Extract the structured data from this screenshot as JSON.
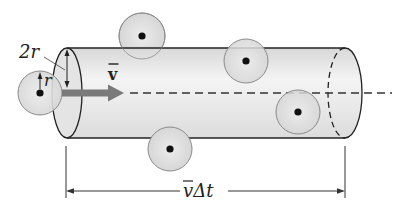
{
  "labels": {
    "diameter": "2r",
    "radius": "r",
    "velocity": "v",
    "distance": "v̄Δt",
    "distance_v": "v",
    "distance_rest": "Δt"
  },
  "colors": {
    "cylinder_fill": "#e9e9e9",
    "sphere_fill": "#dcdcdc",
    "sphere_stroke": "#8a8a8a",
    "outline": "#222222",
    "arrow": "#7a7a7a"
  },
  "molecules": [
    {
      "cx": 40,
      "cy": 93,
      "r": 22
    },
    {
      "cx": 142,
      "cy": 36,
      "r": 23
    },
    {
      "cx": 246,
      "cy": 61,
      "r": 22
    },
    {
      "cx": 298,
      "cy": 112,
      "r": 22
    },
    {
      "cx": 170,
      "cy": 149,
      "r": 22
    }
  ]
}
